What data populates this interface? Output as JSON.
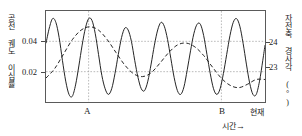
{
  "figure": {
    "axis_left_label": "공전 궤도 이심률",
    "axis_right_label": "자전축 경사각 (°)",
    "time_axis_label": "시간",
    "time_axis_arrow": "→"
  },
  "ticks": {
    "left": [
      "0.04",
      "0.02"
    ],
    "right": [
      "24",
      "23"
    ]
  },
  "xmarks": {
    "a": "A",
    "b": "B",
    "present": "현재"
  },
  "chart_data": {
    "type": "line",
    "title": "",
    "xlabel": "시간",
    "ylabel": "공전 궤도 이심률",
    "ylabel_right": "자전축 경사각 (°)",
    "grid": true,
    "legend": "none",
    "xlim": [
      0,
      100
    ],
    "ylim_left": [
      0.006,
      0.054
    ],
    "ylim_right": [
      22.55,
      24.45
    ],
    "left_ticks": [
      0.04,
      0.02
    ],
    "right_ticks": [
      24,
      23
    ],
    "annotations": [
      {
        "label": "A",
        "x": 19.5,
        "type": "vertical-dotted-line"
      },
      {
        "label": "B",
        "x": 80.0,
        "type": "vertical-dotted-line"
      },
      {
        "label": "현재",
        "x": 100,
        "type": "axis-end-label"
      }
    ],
    "series": [
      {
        "name": "공전 궤도 이심률",
        "axis": "left",
        "style": "solid",
        "color": "#222222",
        "description": "고주파 진동, 약 9주기",
        "x": [
          0,
          1.5,
          3,
          4.5,
          6,
          7.5,
          9,
          10.5,
          12,
          13.5,
          15,
          16.5,
          18,
          19.5,
          21,
          22.5,
          24,
          25.5,
          27,
          28.5,
          30,
          31.5,
          33,
          34.5,
          36,
          37.5,
          39,
          40.5,
          42,
          43.5,
          45,
          46.5,
          48,
          49.5,
          51,
          52.5,
          54,
          55.5,
          57,
          58.5,
          60,
          61.5,
          63,
          64.5,
          66,
          67.5,
          69,
          70.5,
          72,
          73.5,
          75,
          76.5,
          78,
          79.5,
          81,
          82.5,
          84,
          85.5,
          87,
          88.5,
          90,
          91.5,
          93,
          94.5,
          96,
          97.5,
          99,
          100
        ],
        "y": [
          0.037,
          0.045,
          0.05,
          0.048,
          0.04,
          0.028,
          0.017,
          0.01,
          0.009,
          0.015,
          0.025,
          0.036,
          0.045,
          0.05,
          0.049,
          0.042,
          0.031,
          0.02,
          0.013,
          0.01,
          0.013,
          0.021,
          0.031,
          0.04,
          0.045,
          0.044,
          0.038,
          0.028,
          0.019,
          0.013,
          0.012,
          0.017,
          0.026,
          0.036,
          0.044,
          0.048,
          0.046,
          0.039,
          0.029,
          0.019,
          0.012,
          0.01,
          0.014,
          0.023,
          0.033,
          0.042,
          0.047,
          0.047,
          0.041,
          0.031,
          0.021,
          0.013,
          0.01,
          0.013,
          0.021,
          0.031,
          0.041,
          0.048,
          0.05,
          0.046,
          0.037,
          0.026,
          0.016,
          0.01,
          0.01,
          0.017,
          0.028,
          0.036
        ]
      },
      {
        "name": "자전축 경사각",
        "axis": "right",
        "style": "dashed",
        "color": "#222222",
        "description": "저주파 진동, 약 3주기, 현재로 갈수록 낮아짐",
        "x": [
          0,
          4,
          8,
          12,
          16,
          20,
          24,
          28,
          32,
          36,
          40,
          44,
          48,
          52,
          56,
          60,
          64,
          68,
          72,
          76,
          80,
          84,
          88,
          92,
          96,
          100
        ],
        "y": [
          23.05,
          23.25,
          23.55,
          23.85,
          24.05,
          24.12,
          24.05,
          23.85,
          23.58,
          23.32,
          23.14,
          23.08,
          23.16,
          23.36,
          23.58,
          23.74,
          23.78,
          23.7,
          23.52,
          23.28,
          23.05,
          22.9,
          22.85,
          22.92,
          23.02,
          23.02
        ]
      }
    ]
  }
}
